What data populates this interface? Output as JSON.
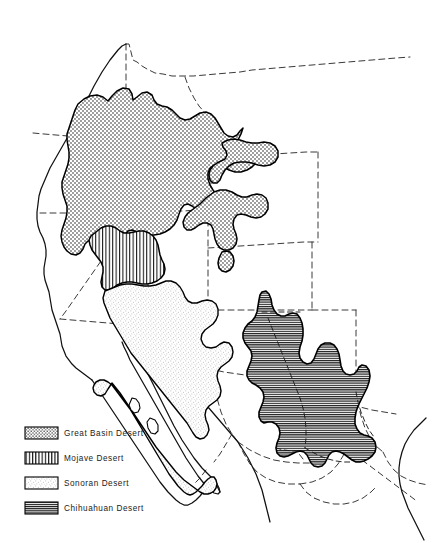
{
  "figure": {
    "kind": "map",
    "title_visible": false,
    "background_color": "#ffffff",
    "ink_color": "#000000",
    "width": 435,
    "height": 543
  },
  "legend": {
    "name": "desert-legend",
    "items": [
      {
        "label": "Great Basin Desert",
        "pattern": "coarse-dots",
        "swatch_name": "legend-swatch-great-basin"
      },
      {
        "label": "Mojave Desert",
        "pattern": "vertical-stripes",
        "swatch_name": "legend-swatch-mojave"
      },
      {
        "label": "Sonoran Desert",
        "pattern": "fine-stipple",
        "swatch_name": "legend-swatch-sonoran"
      },
      {
        "label": "Chihuahuan Desert",
        "pattern": "horizontal-stripes",
        "swatch_name": "legend-swatch-chihuahuan"
      }
    ]
  },
  "map_features": {
    "coastline_name": "pacific-coastline",
    "border_style": "dashed",
    "regions": [
      {
        "name": "great-basin-desert-region",
        "pattern": "coarse-dots"
      },
      {
        "name": "mojave-desert-region",
        "pattern": "vertical-stripes"
      },
      {
        "name": "sonoran-desert-region",
        "pattern": "fine-stipple"
      },
      {
        "name": "chihuahuan-desert-region",
        "pattern": "horizontal-stripes"
      }
    ]
  }
}
